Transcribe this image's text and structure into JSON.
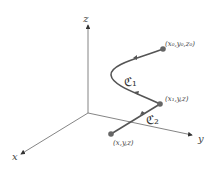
{
  "axes": {
    "x_label": "x",
    "y_label": "y",
    "z_label": "z"
  },
  "points": {
    "start": "(x₀,y₀,z₀)",
    "middle": "(x₁,y,z)",
    "end": "(x,y,z)"
  },
  "curves": {
    "c1": "ℭ₁",
    "c2": "ℭ₂"
  },
  "colors": {
    "curve": "#555555",
    "point": "#666666",
    "axis": "#555555"
  }
}
